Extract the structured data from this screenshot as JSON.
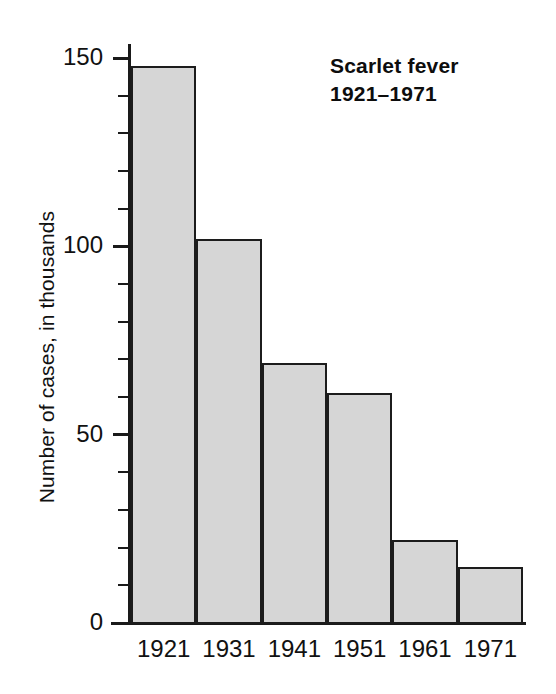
{
  "chart_data": {
    "type": "bar",
    "title": "Scarlet fever",
    "subtitle": "1921–1971",
    "categories": [
      "1921",
      "1931",
      "1941",
      "1951",
      "1961",
      "1971"
    ],
    "values": [
      148,
      102,
      69,
      61,
      22,
      15
    ],
    "xlabel": "",
    "ylabel": "Number of cases, in thousands",
    "ylim": [
      0,
      152
    ],
    "y_major_ticks": [
      0,
      50,
      100,
      150
    ],
    "y_major_tick_labels": [
      "0",
      "50",
      "100",
      "150"
    ],
    "y_minor_tick_step": 10,
    "grid": false,
    "legend": false,
    "bar_fill_color": "#d6d6d6",
    "bar_edge_color": "#1c1c1c",
    "axis_color": "#1a1a1a",
    "background_color": "#ffffff",
    "bar_gap": 0
  }
}
